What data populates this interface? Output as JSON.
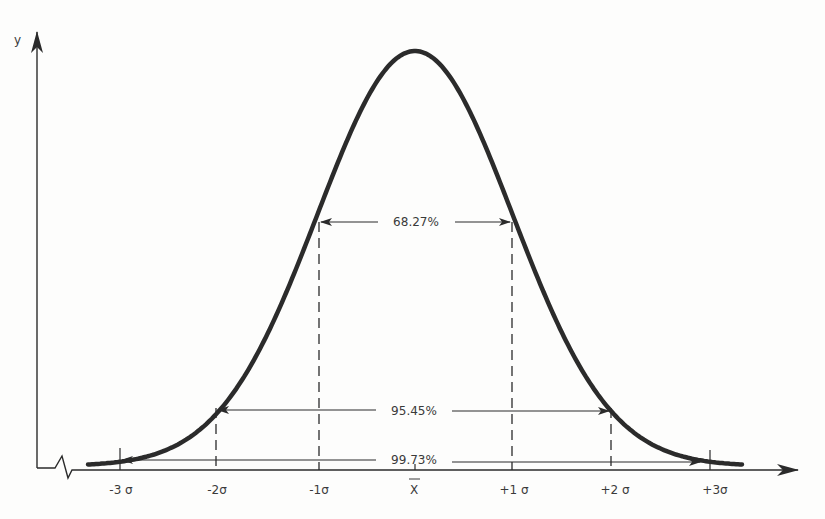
{
  "chart_data": {
    "type": "line",
    "title": "",
    "xlabel": "",
    "ylabel": "y",
    "x_ticks": [
      "-3 σ",
      "-2σ",
      "-1σ",
      "X̄",
      "+1 σ",
      "+2 σ",
      "+3σ"
    ],
    "x_tick_values": [
      -3,
      -2,
      -1,
      0,
      1,
      2,
      3
    ],
    "xlim": [
      -3.4,
      3.4
    ],
    "grid": false,
    "series": [
      {
        "name": "normal curve",
        "x": [
          -3.4,
          -3,
          -2.5,
          -2,
          -1.5,
          -1,
          -0.5,
          0,
          0.5,
          1,
          1.5,
          2,
          2.5,
          3,
          3.4
        ],
        "values": [
          0.0012,
          0.0044,
          0.0175,
          0.054,
          0.1295,
          0.242,
          0.352,
          0.399,
          0.352,
          0.242,
          0.1295,
          0.054,
          0.0175,
          0.0044,
          0.0012
        ]
      }
    ],
    "annotations": [
      {
        "label": "68.27%",
        "from": -1,
        "to": 1
      },
      {
        "label": "95.45%",
        "from": -2,
        "to": 2
      },
      {
        "label": "99.73%",
        "from": -3,
        "to": 3
      }
    ]
  },
  "labels": {
    "y_axis": "y",
    "pct1": "68.27%",
    "pct2": "95.45%",
    "pct3": "99.73%",
    "ticks": [
      "-3 σ",
      "-2σ",
      "-1σ",
      "X",
      "+1 σ",
      "+2 σ",
      "+3σ"
    ]
  },
  "colors": {
    "ink": "#2b2b2b",
    "background": "#fdfdfc"
  }
}
